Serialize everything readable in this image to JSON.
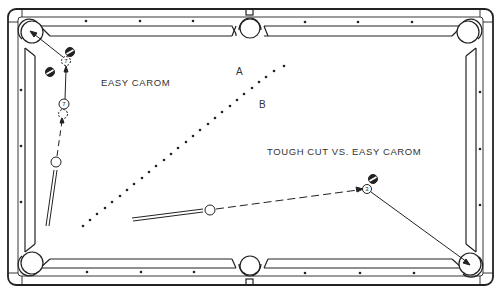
{
  "diagram": {
    "labels": {
      "easy_carom": "EASY CAROM",
      "tough_cut": "TOUGH CUT VS. EASY CAROM",
      "point_a": "A",
      "point_b": "B"
    },
    "balls": {
      "seven_top": "7",
      "seven_mid": "7",
      "three": "3"
    },
    "colors": {
      "line": "#222222",
      "background": "#ffffff"
    }
  }
}
